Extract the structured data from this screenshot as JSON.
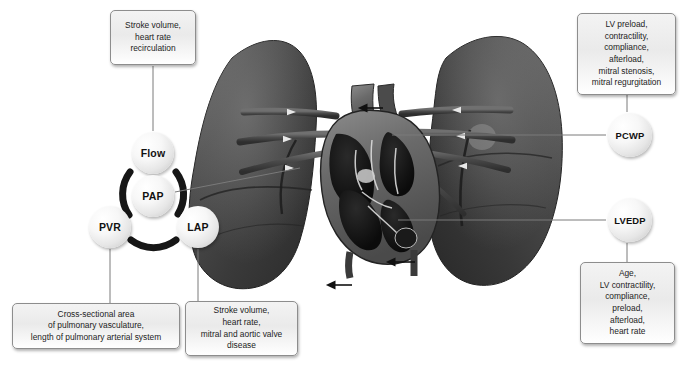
{
  "figure": {
    "background_color": "#ffffff",
    "text_color": "#1c1c1c",
    "box_border_color": "#8d8d8d",
    "ring_color": "#1a1a1a",
    "leader_color": "#6e6e6e"
  },
  "nodes": [
    {
      "id": "flow",
      "label": "Flow",
      "cx": 153,
      "cy": 153,
      "r": 21
    },
    {
      "id": "pap",
      "label": "PAP",
      "cx": 153,
      "cy": 196,
      "r": 21
    },
    {
      "id": "pvr",
      "label": "PVR",
      "cx": 110,
      "cy": 227,
      "r": 21
    },
    {
      "id": "lap",
      "label": "LAP",
      "cx": 198,
      "cy": 227,
      "r": 21
    },
    {
      "id": "pcwp",
      "label": "PCWP",
      "cx": 630,
      "cy": 135,
      "r": 22
    },
    {
      "id": "lvedp",
      "label": "LVEDP",
      "cx": 630,
      "cy": 220,
      "r": 22
    }
  ],
  "callouts": [
    {
      "id": "flow-box",
      "for": "flow",
      "text": "Stroke volume,\nheart rate\nrecirculation",
      "x": 110,
      "y": 10,
      "w": 86,
      "h": 55
    },
    {
      "id": "pvr-box",
      "for": "pvr",
      "text": "Cross-sectional area\nof pulmonary vasculature,\nlength of pulmonary arterial system",
      "x": 12,
      "y": 303,
      "w": 168,
      "h": 46
    },
    {
      "id": "lap-box",
      "for": "lap",
      "text": "Stroke volume,\nheart rate,\nmitral and aortic valve\ndisease",
      "x": 185,
      "y": 301,
      "w": 113,
      "h": 55
    },
    {
      "id": "pcwp-box",
      "for": "pcwp",
      "text": "LV preload,\ncontractility,\ncompliance,\nafterload,\nmitral stenosis,\nmitral regurgitation",
      "x": 577,
      "y": 13,
      "w": 99,
      "h": 82
    },
    {
      "id": "lvedp-box",
      "for": "lvedp",
      "text": "Age,\nLV contractility,\ncompliance,\npreload,\nafterload,\nheart rate",
      "x": 580,
      "y": 262,
      "w": 95,
      "h": 82
    }
  ],
  "anatomy": {
    "left_lung_label": "left-lung",
    "right_lung_label": "right-lung",
    "heart_label": "heart-cross-section",
    "arrows": [
      {
        "id": "inflow-arrow",
        "direction": "up",
        "x": 352,
        "y": 268
      },
      {
        "id": "outflow-arrow",
        "direction": "down",
        "x": 415,
        "y": 268
      },
      {
        "id": "pulmonary-artery-arrow",
        "direction": "up",
        "x": 383,
        "y": 90
      }
    ]
  }
}
